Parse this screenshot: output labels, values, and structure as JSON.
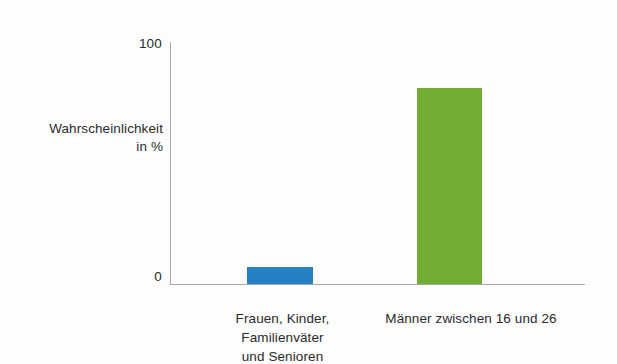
{
  "axis": {
    "y_title_line1": "Wahrscheinlichkeit",
    "y_title_line2": "in %",
    "y_tick_top": "100",
    "y_tick_bottom": "0"
  },
  "categories": {
    "cat0_line1": "Frauen, Kinder,",
    "cat0_line2": "Familienväter",
    "cat0_line3": "und Senioren",
    "cat1_line1": "Männer zwischen 16 und 26"
  },
  "colors": {
    "bar_blue": "#2581c4",
    "bar_green": "#71ad34",
    "axis_line": "#a9a9a9",
    "background": "#fdfdfd",
    "text": "#2b2b2b"
  },
  "chart_data": {
    "type": "bar",
    "title": "",
    "xlabel": "",
    "ylabel": "Wahrscheinlichkeit in %",
    "ylim": [
      0,
      100
    ],
    "yticks": [
      0,
      100
    ],
    "grid": false,
    "legend": "none",
    "categories": [
      "Frauen, Kinder, Familienväter und Senioren",
      "Männer zwischen 16 und 26"
    ],
    "values": [
      7,
      81
    ],
    "colors": [
      "#2581c4",
      "#71ad34"
    ]
  }
}
